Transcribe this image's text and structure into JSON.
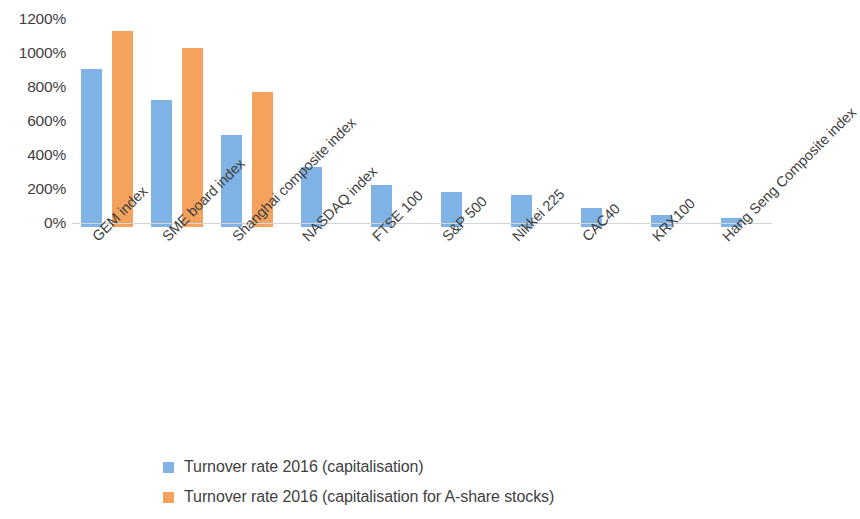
{
  "chart_data": {
    "type": "bar",
    "title": "",
    "subtitle": "",
    "xlabel": "",
    "ylabel": "",
    "ylim": [
      0,
      1200
    ],
    "ytick_values": [
      1200,
      1000,
      800,
      600,
      400,
      200,
      0
    ],
    "ytick_labels": [
      "1200%",
      "1000%",
      "800%",
      "600%",
      "400%",
      "200%",
      "0%"
    ],
    "grid": false,
    "legend_position": "bottom-left",
    "categories": [
      "GEM index",
      "SME board index",
      "Shanghai composite index",
      "NASDAQ index",
      "FTSE 100",
      "S&P 500",
      "Nikkei 225",
      "CAC40",
      "KRX100",
      "Hang Seng Composite index"
    ],
    "series": [
      {
        "name": "Turnover rate 2016 (capitalisation)",
        "color": "#7FB2E5",
        "values": [
          930,
          745,
          540,
          355,
          245,
          205,
          190,
          110,
          70,
          55
        ]
      },
      {
        "name": "Turnover rate 2016 (capitalisation for A-share stocks)",
        "color": "#F4A25D",
        "values": [
          1155,
          1055,
          795,
          null,
          null,
          null,
          null,
          null,
          null,
          null
        ]
      }
    ]
  },
  "axis": {
    "ticks": [
      {
        "label": "1200%",
        "value": 1200
      },
      {
        "label": "1000%",
        "value": 1000
      },
      {
        "label": "800%",
        "value": 800
      },
      {
        "label": "600%",
        "value": 600
      },
      {
        "label": "400%",
        "value": 400
      },
      {
        "label": "200%",
        "value": 200
      },
      {
        "label": "0%",
        "value": 0
      }
    ]
  },
  "legend": {
    "items": [
      {
        "label": "Turnover rate 2016 (capitalisation)",
        "color": "#7FB2E5"
      },
      {
        "label": "Turnover rate 2016 (capitalisation for A-share stocks)",
        "color": "#F4A25D"
      }
    ]
  },
  "colors": {
    "series_blue": "#7FB2E5",
    "series_orange": "#F4A25D",
    "axis_line": "#d6d6d6",
    "text": "#3f3f3f",
    "background": "#ffffff"
  }
}
